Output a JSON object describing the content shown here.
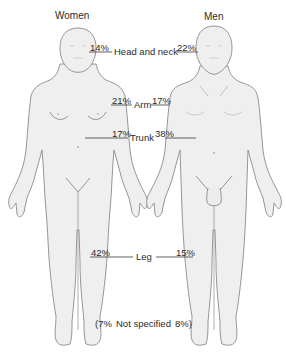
{
  "figure": {
    "columns": {
      "women": "Women",
      "men": "Men"
    },
    "regions": [
      {
        "name": "Head and neck",
        "women": "14%",
        "men": "22%"
      },
      {
        "name": "Arm",
        "women": "21%",
        "men": "17%"
      },
      {
        "name": "Trunk",
        "women": "17%",
        "men": "38%"
      },
      {
        "name": "Leg",
        "women": "42%",
        "men": "15%"
      }
    ],
    "not_specified": {
      "open": "(7%",
      "label": "Not specified",
      "close": "8%)"
    },
    "colors": {
      "body_fill": "#efefef",
      "outline": "#8a8a8a",
      "leader_line": "#3a3a3a",
      "text": "#2a2a2a"
    }
  }
}
